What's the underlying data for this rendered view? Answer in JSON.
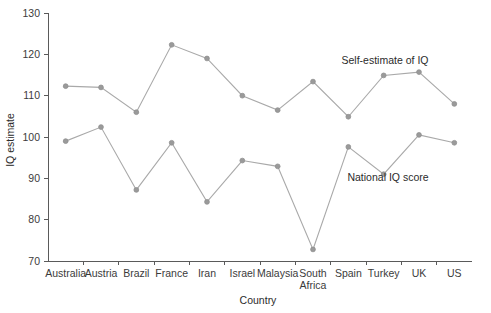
{
  "chart_data": {
    "type": "line",
    "title": "",
    "xlabel": "Country",
    "ylabel": "IQ estimate",
    "categories": [
      "Australia",
      "Austria",
      "Brazil",
      "France",
      "Iran",
      "Israel",
      "Malaysia",
      "South Africa",
      "Spain",
      "Turkey",
      "UK",
      "US"
    ],
    "category_lines": [
      [
        "Australia"
      ],
      [
        "Austria"
      ],
      [
        "Brazil"
      ],
      [
        "France"
      ],
      [
        "Iran"
      ],
      [
        "Israel"
      ],
      [
        "Malaysia"
      ],
      [
        "South",
        "Africa"
      ],
      [
        "Spain"
      ],
      [
        "Turkey"
      ],
      [
        "UK"
      ],
      [
        "US"
      ]
    ],
    "ylim": [
      70,
      130
    ],
    "yticks": [
      70,
      80,
      90,
      100,
      110,
      120,
      130
    ],
    "ytick_labels": [
      "70",
      "80",
      "90",
      "100",
      "110",
      "120",
      "130"
    ],
    "grid": false,
    "legend_position": "inline-annotation",
    "series": [
      {
        "name": "Self-estimate of IQ",
        "color": "#a9a9a9",
        "annotation": "Self-estimate of IQ",
        "values": [
          112.3,
          112.0,
          106.0,
          122.3,
          119.0,
          110.0,
          106.5,
          113.4,
          104.9,
          114.9,
          115.7,
          108.0
        ]
      },
      {
        "name": "National IQ score",
        "color": "#a9a9a9",
        "annotation": "National IQ score",
        "values": [
          99.0,
          102.4,
          87.2,
          98.6,
          84.3,
          94.3,
          92.9,
          72.8,
          97.6,
          91.0,
          100.5,
          98.6
        ]
      }
    ],
    "annotations": [
      {
        "text": "Self-estimate of IQ",
        "x_px": 385,
        "y_px": 64
      },
      {
        "text": "National IQ score",
        "x_px": 388,
        "y_px": 181
      }
    ],
    "colors": {
      "line": "#a9a9a9",
      "marker": "#9a9a9a",
      "axis": "#5a5a5a",
      "text": "#2b2b2b",
      "background": "#ffffff"
    }
  }
}
